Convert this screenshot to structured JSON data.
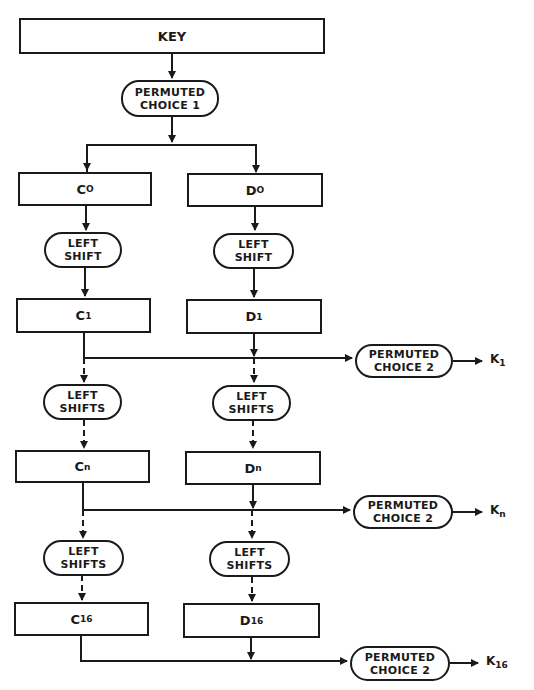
{
  "diagram": {
    "key": "KEY",
    "pc1": [
      "PERMUTED",
      "CHOICE 1"
    ],
    "rows": [
      {
        "c": {
          "base": "C",
          "sub": "O"
        },
        "d": {
          "base": "D",
          "sub": "O"
        }
      },
      {
        "c": {
          "base": "C",
          "sub": "1"
        },
        "d": {
          "base": "D",
          "sub": "1"
        }
      },
      {
        "c": {
          "base": "C",
          "sub": "n"
        },
        "d": {
          "base": "D",
          "sub": "n"
        }
      },
      {
        "c": {
          "base": "C",
          "sub": "16"
        },
        "d": {
          "base": "D",
          "sub": "16"
        }
      }
    ],
    "shifts": [
      [
        "LEFT",
        "SHIFT"
      ],
      [
        "LEFT",
        "SHIFTS"
      ],
      [
        "LEFT",
        "SHIFTS"
      ]
    ],
    "pc2": [
      "PERMUTED",
      "CHOICE 2"
    ],
    "outputs": [
      {
        "base": "K",
        "sub": "1"
      },
      {
        "base": "K",
        "sub": "n"
      },
      {
        "base": "K",
        "sub": "16"
      }
    ]
  },
  "colors": {
    "ink": "#1a1a1a",
    "paper": "#ffffff"
  }
}
